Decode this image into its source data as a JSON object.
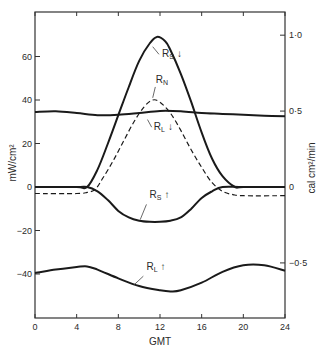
{
  "chart_data": {
    "type": "line",
    "title": "",
    "xlabel": "GMT",
    "ylabel": "mW/cm²",
    "ylabel_right": "cal cm²/min",
    "xlim": [
      0,
      24
    ],
    "ylim": [
      -60,
      82
    ],
    "ylim_right_ticks": [
      "1·0",
      "0·5",
      "0",
      "−0·5"
    ],
    "x_ticks": [
      0,
      4,
      8,
      12,
      16,
      20,
      24
    ],
    "y_ticks": [
      60,
      40,
      20,
      0,
      -20,
      -40
    ],
    "y_tick_labels": [
      "60",
      "40",
      "20",
      "0",
      "−20",
      "−40"
    ],
    "right_ticks": [
      {
        "label": "1·0",
        "value": 69.8
      },
      {
        "label": "0·5",
        "value": 34.9
      },
      {
        "label": "0",
        "value": 0
      },
      {
        "label": "−0·5",
        "value": -34.9
      }
    ],
    "grid": false,
    "series": [
      {
        "name": "R_S (incoming shortwave)",
        "label": "R_S ↓",
        "style": "solid",
        "x": [
          0,
          4,
          5.0,
          6,
          7,
          8,
          9,
          10,
          11,
          11.7,
          12.5,
          13,
          14,
          15,
          16,
          17,
          18,
          19.2,
          20,
          24
        ],
        "values": [
          0,
          0,
          0,
          8,
          20,
          33,
          46,
          58,
          66,
          69,
          67,
          63,
          52,
          39,
          25,
          13,
          5,
          0,
          0,
          0
        ]
      },
      {
        "name": "R_N (net radiation)",
        "label": "R_N",
        "style": "dashed",
        "x": [
          0,
          4,
          5,
          5.8,
          6.5,
          7.5,
          8.5,
          9.5,
          10.5,
          11.3,
          12,
          13,
          14,
          15,
          16,
          17,
          18,
          19,
          20,
          24
        ],
        "values": [
          -3,
          -3,
          -2.5,
          -1,
          4,
          12,
          21,
          30,
          37,
          40,
          39,
          34,
          26,
          17,
          9,
          2,
          -2,
          -3.5,
          -4,
          -4
        ]
      },
      {
        "name": "R_L (incoming longwave)",
        "label": "R_L ↓",
        "style": "solid",
        "x": [
          0,
          2,
          4,
          6,
          8,
          10,
          12,
          14,
          16,
          18,
          20,
          22,
          24
        ],
        "values": [
          34.5,
          34.8,
          34,
          33,
          33.2,
          34,
          35,
          34.8,
          34,
          33.6,
          33.2,
          32.8,
          32.5
        ]
      },
      {
        "name": "R_S (reflected shortwave)",
        "label": "R_S ↑",
        "style": "solid",
        "x": [
          0,
          4,
          5.0,
          6,
          7,
          8,
          9,
          10,
          11,
          12,
          13,
          14,
          15,
          16,
          17,
          18,
          20,
          24
        ],
        "values": [
          0,
          0,
          0,
          -2,
          -6,
          -11,
          -14,
          -15.5,
          -16,
          -16,
          -15.5,
          -14,
          -10,
          -5,
          -2,
          0,
          0,
          0
        ]
      },
      {
        "name": "R_L (outgoing longwave)",
        "label": "R_L ↑",
        "style": "solid",
        "x": [
          0,
          2,
          4,
          5,
          6,
          8,
          10,
          12,
          13,
          14,
          16,
          18,
          20,
          22,
          24
        ],
        "values": [
          -39.5,
          -38,
          -36.8,
          -36.5,
          -38,
          -42,
          -45.5,
          -47.5,
          -48,
          -47.5,
          -44,
          -39,
          -36,
          -36,
          -38.5
        ]
      }
    ],
    "annotations": [
      {
        "text": "R",
        "sub": "S",
        "arrow": "↓",
        "x": 12.2,
        "y": 60
      },
      {
        "text": "R",
        "sub": "N",
        "arrow": "",
        "x": 11.6,
        "y": 48
      },
      {
        "text": "R",
        "sub": "L",
        "arrow": "↓",
        "x": 11.4,
        "y": 26
      },
      {
        "text": "R",
        "sub": "S",
        "arrow": "↑",
        "x": 11.0,
        "y": -5
      },
      {
        "text": "R",
        "sub": "L",
        "arrow": "↑",
        "x": 10.7,
        "y": -38
      }
    ]
  }
}
